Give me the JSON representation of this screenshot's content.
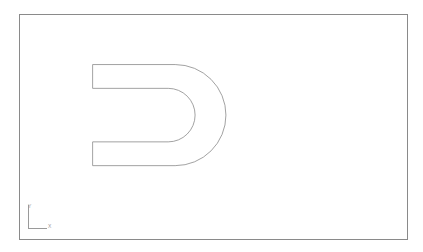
{
  "app": {
    "title": "CAD Drawing Viewport",
    "background_color": "#ffffff"
  },
  "viewport": {
    "name": "drawing-area",
    "border_color": "#8a8a8a",
    "background_color": "#ffffff",
    "bounds": {
      "x": 19,
      "y": 14,
      "width": 389,
      "height": 226
    }
  },
  "drawing": {
    "line_color": "#8a8a8a",
    "line_width": 0.8,
    "fill": "none",
    "shape_name": "slot-profile-outline",
    "description": "Closed profile resembling a D / rotated C: two horizontal parallel arms open at the left, joined on the right by concentric outer and inner semicircular arcs.",
    "outer_path": "M 73 50 L 156 50 A 51 51 0 0 1 156 152 L 73 152",
    "inner_path": "M 73 74 L 149 74 A 26 26 0 0 1 149 128 L 73 128",
    "left_cap_top": "M 73 50 L 73 74",
    "left_cap_bottom": "M 73 128 L 73 152",
    "geometry": {
      "outer_arc_radius": 51,
      "inner_arc_radius": 26,
      "arm_thickness": 24,
      "outer_top_y": 50,
      "outer_bottom_y": 152,
      "inner_top_y": 74,
      "inner_bottom_y": 128,
      "open_edge_x": 73,
      "arc_start_x": 156,
      "outer_extent_x": 207,
      "inner_extent_x": 175
    }
  },
  "ucs_icon": {
    "name": "ucs-axis-tripod",
    "color": "#9a9a9a",
    "y_axis_label": "Y",
    "x_axis_label": "X",
    "origin": {
      "x": 24,
      "y": 202
    }
  }
}
